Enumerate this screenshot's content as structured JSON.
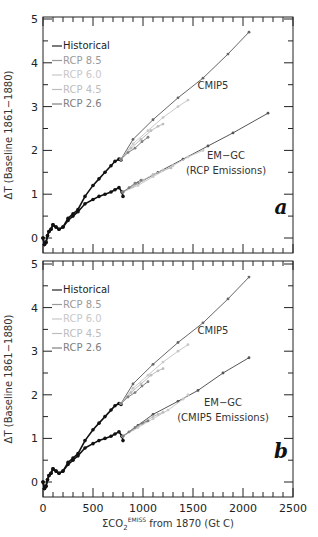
{
  "chart_data": [
    {
      "panel": "a",
      "type": "line",
      "title": "",
      "xlabel": "ΣCO2 EMISS from 1870 (Gt C)",
      "ylabel": "ΔT (Baseline 1861−1880)",
      "xlim": [
        0,
        2500
      ],
      "ylim": [
        -0.3,
        5
      ],
      "yticks": [
        0,
        1,
        2,
        3,
        4,
        5
      ],
      "xticks": [
        0,
        500,
        1000,
        1500,
        2000,
        2500
      ],
      "grid": false,
      "legend": {
        "position": "upper left",
        "entries": [
          {
            "label": "Historical",
            "color": "#222222"
          },
          {
            "label": "RCP 8.5",
            "color": "#9a9a9a"
          },
          {
            "label": "RCP 6.0",
            "color": "#c8c8c8"
          },
          {
            "label": "RCP 4.5",
            "color": "#bdbdbd"
          },
          {
            "label": "RCP 2.6",
            "color": "#808080"
          }
        ]
      },
      "annotations": [
        {
          "text": "CMIP5",
          "x": 1700,
          "y": 3.4
        },
        {
          "text": "EM−GC",
          "x": 1830,
          "y": 1.8
        },
        {
          "text": "(RCP Emissions)",
          "x": 1830,
          "y": 1.45
        },
        {
          "text": "a",
          "x": 2380,
          "y": 0.55
        }
      ],
      "series": [
        {
          "name": "Historical (CMIP5)",
          "color": "#111111",
          "x": [
            0,
            15,
            30,
            45,
            60,
            80,
            100,
            130,
            160,
            200,
            250,
            300,
            350,
            420,
            500,
            560,
            620,
            680,
            720,
            760,
            780
          ],
          "y": [
            0.0,
            -0.15,
            -0.1,
            0.05,
            0.15,
            0.2,
            0.3,
            0.25,
            0.2,
            0.25,
            0.45,
            0.55,
            0.65,
            0.95,
            1.2,
            1.35,
            1.5,
            1.65,
            1.75,
            1.8,
            1.78
          ]
        },
        {
          "name": "Historical (EM-GC)",
          "color": "#111111",
          "x": [
            0,
            15,
            30,
            45,
            60,
            80,
            100,
            130,
            160,
            200,
            250,
            300,
            350,
            420,
            500,
            560,
            620,
            680,
            720,
            760,
            790,
            800
          ],
          "y": [
            0.0,
            -0.15,
            -0.1,
            0.05,
            0.15,
            0.2,
            0.3,
            0.25,
            0.2,
            0.25,
            0.4,
            0.5,
            0.6,
            0.78,
            0.88,
            0.95,
            1.0,
            1.05,
            1.1,
            1.15,
            1.05,
            0.95
          ]
        },
        {
          "name": "CMIP5 RCP 8.5",
          "color": "#666666",
          "x": [
            780,
            900,
            1100,
            1350,
            1600,
            1850,
            2060
          ],
          "y": [
            1.8,
            2.25,
            2.7,
            3.2,
            3.65,
            4.2,
            4.7
          ]
        },
        {
          "name": "CMIP5 RCP 6.0",
          "color": "#c8c8c8",
          "x": [
            780,
            900,
            1050,
            1200,
            1350,
            1450
          ],
          "y": [
            1.8,
            2.15,
            2.45,
            2.75,
            3.0,
            3.15
          ]
        },
        {
          "name": "CMIP5 RCP 4.5",
          "color": "#bdbdbd",
          "x": [
            780,
            880,
            980,
            1080,
            1150,
            1200
          ],
          "y": [
            1.8,
            2.05,
            2.25,
            2.45,
            2.55,
            2.6
          ]
        },
        {
          "name": "CMIP5 RCP 2.6",
          "color": "#808080",
          "x": [
            780,
            850,
            920,
            990,
            1050
          ],
          "y": [
            1.8,
            1.95,
            2.05,
            2.2,
            2.3
          ]
        },
        {
          "name": "EM-GC RCP 8.5",
          "color": "#555555",
          "x": [
            800,
            950,
            1150,
            1400,
            1650,
            1900,
            2250
          ],
          "y": [
            1.05,
            1.25,
            1.5,
            1.8,
            2.1,
            2.4,
            2.85
          ]
        },
        {
          "name": "EM-GC RCP 6.0",
          "color": "#c8c8c8",
          "x": [
            800,
            950,
            1100,
            1300,
            1450,
            1600
          ],
          "y": [
            1.05,
            1.2,
            1.4,
            1.65,
            1.85,
            2.0
          ]
        },
        {
          "name": "EM-GC RCP 4.5",
          "color": "#bdbdbd",
          "x": [
            800,
            900,
            1000,
            1100,
            1200,
            1280
          ],
          "y": [
            1.05,
            1.18,
            1.32,
            1.45,
            1.55,
            1.6
          ]
        },
        {
          "name": "EM-GC RCP 2.6",
          "color": "#808080",
          "x": [
            800,
            860,
            920,
            980
          ],
          "y": [
            1.05,
            1.15,
            1.25,
            1.32
          ]
        }
      ]
    },
    {
      "panel": "b",
      "type": "line",
      "title": "",
      "xlabel": "ΣCO2 EMISS from 1870 (Gt C)",
      "ylabel": "ΔT (Baseline 1861−1880)",
      "xlim": [
        0,
        2500
      ],
      "ylim": [
        -0.3,
        5
      ],
      "yticks": [
        0,
        1,
        2,
        3,
        4,
        5
      ],
      "xticks": [
        0,
        500,
        1000,
        1500,
        2000,
        2500
      ],
      "grid": false,
      "legend": {
        "position": "upper left",
        "entries": [
          {
            "label": "Historical",
            "color": "#222222"
          },
          {
            "label": "RCP 8.5",
            "color": "#9a9a9a"
          },
          {
            "label": "RCP 6.0",
            "color": "#c8c8c8"
          },
          {
            "label": "RCP 4.5",
            "color": "#bdbdbd"
          },
          {
            "label": "RCP 2.6",
            "color": "#808080"
          }
        ]
      },
      "annotations": [
        {
          "text": "CMIP5",
          "x": 1700,
          "y": 3.4
        },
        {
          "text": "EM−GC",
          "x": 1800,
          "y": 1.75
        },
        {
          "text": "(CMIP5 Emissions)",
          "x": 1800,
          "y": 1.4
        },
        {
          "text": "b",
          "x": 2380,
          "y": 0.55
        }
      ],
      "series": [
        {
          "name": "Historical (CMIP5)",
          "color": "#111111",
          "x": [
            0,
            15,
            30,
            45,
            60,
            80,
            100,
            130,
            160,
            200,
            250,
            300,
            350,
            420,
            500,
            560,
            620,
            680,
            720,
            760,
            780
          ],
          "y": [
            0.0,
            -0.15,
            -0.1,
            0.05,
            0.15,
            0.2,
            0.3,
            0.25,
            0.2,
            0.25,
            0.45,
            0.55,
            0.65,
            0.95,
            1.2,
            1.35,
            1.5,
            1.65,
            1.75,
            1.8,
            1.78
          ]
        },
        {
          "name": "Historical (EM-GC)",
          "color": "#111111",
          "x": [
            0,
            15,
            30,
            45,
            60,
            80,
            100,
            130,
            160,
            200,
            250,
            300,
            350,
            420,
            500,
            560,
            620,
            680,
            720,
            760,
            790,
            800
          ],
          "y": [
            0.0,
            -0.15,
            -0.1,
            0.05,
            0.15,
            0.2,
            0.3,
            0.25,
            0.2,
            0.25,
            0.4,
            0.5,
            0.6,
            0.78,
            0.88,
            0.95,
            1.0,
            1.05,
            1.1,
            1.15,
            1.05,
            0.95
          ]
        },
        {
          "name": "CMIP5 RCP 8.5",
          "color": "#666666",
          "x": [
            780,
            900,
            1100,
            1350,
            1600,
            1850,
            2060
          ],
          "y": [
            1.8,
            2.25,
            2.7,
            3.2,
            3.65,
            4.2,
            4.7
          ]
        },
        {
          "name": "CMIP5 RCP 6.0",
          "color": "#c8c8c8",
          "x": [
            780,
            900,
            1050,
            1200,
            1350,
            1450
          ],
          "y": [
            1.8,
            2.15,
            2.45,
            2.75,
            3.0,
            3.15
          ]
        },
        {
          "name": "CMIP5 RCP 4.5",
          "color": "#bdbdbd",
          "x": [
            780,
            880,
            980,
            1080,
            1150,
            1200
          ],
          "y": [
            1.8,
            2.05,
            2.25,
            2.45,
            2.55,
            2.6
          ]
        },
        {
          "name": "CMIP5 RCP 2.6",
          "color": "#808080",
          "x": [
            780,
            850,
            920,
            990,
            1050
          ],
          "y": [
            1.8,
            1.95,
            2.05,
            2.2,
            2.3
          ]
        },
        {
          "name": "EM-GC RCP 8.5",
          "color": "#555555",
          "x": [
            800,
            950,
            1100,
            1350,
            1550,
            1800,
            2060
          ],
          "y": [
            1.05,
            1.3,
            1.55,
            1.85,
            2.1,
            2.5,
            2.85
          ]
        },
        {
          "name": "EM-GC RCP 6.0",
          "color": "#c8c8c8",
          "x": [
            800,
            950,
            1100,
            1250,
            1400,
            1450
          ],
          "y": [
            1.05,
            1.25,
            1.45,
            1.65,
            1.9,
            2.0
          ]
        },
        {
          "name": "EM-GC RCP 4.5",
          "color": "#bdbdbd",
          "x": [
            800,
            900,
            1000,
            1100,
            1150,
            1200
          ],
          "y": [
            1.05,
            1.2,
            1.35,
            1.5,
            1.55,
            1.6
          ]
        },
        {
          "name": "EM-GC RCP 2.6",
          "color": "#808080",
          "x": [
            800,
            860,
            920,
            990,
            1050
          ],
          "y": [
            1.05,
            1.15,
            1.25,
            1.35,
            1.4
          ]
        }
      ]
    }
  ],
  "labels": {
    "ylabel": "ΔT (Baseline 1861−1880)",
    "xlabel_sigma": "ΣCO",
    "xlabel_sub": "2",
    "xlabel_sup": "EMISS",
    "xlabel_rest": " from 1870 (Gt C)"
  }
}
